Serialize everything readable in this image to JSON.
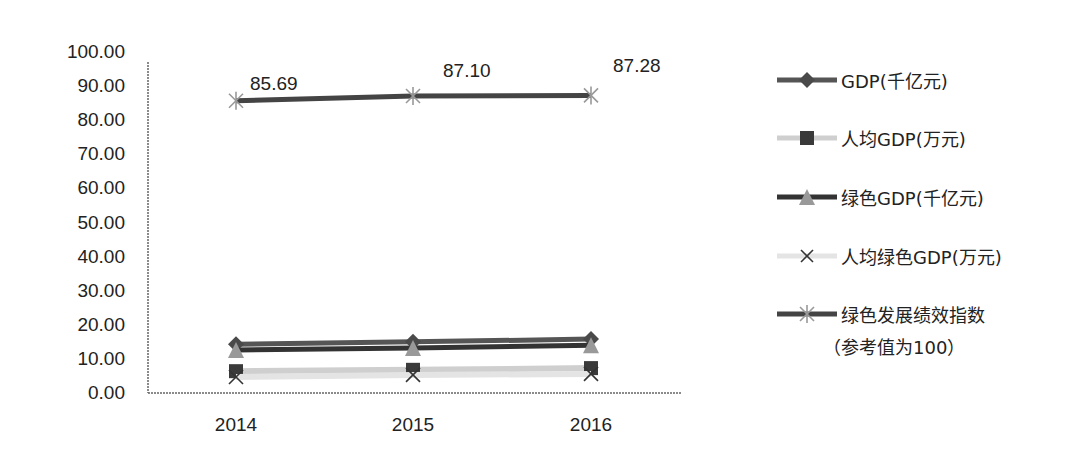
{
  "chart_data": {
    "type": "line",
    "title": "",
    "xlabel": "",
    "ylabel": "",
    "ylim": [
      0,
      100
    ],
    "yticks": [
      "0.00",
      "10.00",
      "20.00",
      "30.00",
      "40.00",
      "50.00",
      "60.00",
      "70.00",
      "80.00",
      "90.00",
      "100.00"
    ],
    "categories": [
      "2014",
      "2015",
      "2016"
    ],
    "grid": false,
    "legend_position": "right",
    "series": [
      {
        "name": "GDP(千亿元)",
        "values": [
          14.3,
          15.0,
          15.8
        ],
        "marker": "diamond",
        "color": "#555555"
      },
      {
        "name": "人均GDP(万元)",
        "values": [
          6.4,
          6.8,
          7.3
        ],
        "marker": "square",
        "color": "#cfcfcf"
      },
      {
        "name": "绿色GDP(千亿元)",
        "values": [
          12.6,
          13.2,
          14.0
        ],
        "marker": "triangle",
        "color": "#333333"
      },
      {
        "name": "人均绿色GDP(万元)",
        "values": [
          4.7,
          5.3,
          5.6
        ],
        "marker": "x",
        "color": "#e4e4e4"
      },
      {
        "name": "绿色发展绩效指数（参考值为100）",
        "values": [
          85.69,
          87.1,
          87.28
        ],
        "marker": "asterisk",
        "color": "#444444",
        "data_labels": [
          "85.69",
          "87.10",
          "87.28"
        ]
      }
    ]
  },
  "legend": {
    "items": [
      {
        "label": "GDP(千亿元)"
      },
      {
        "label": "人均GDP(万元)"
      },
      {
        "label": "绿色GDP(千亿元)"
      },
      {
        "label": "人均绿色GDP(万元)"
      },
      {
        "label": "绿色发展绩效指数",
        "sublabel": "（参考值为100）"
      }
    ]
  }
}
